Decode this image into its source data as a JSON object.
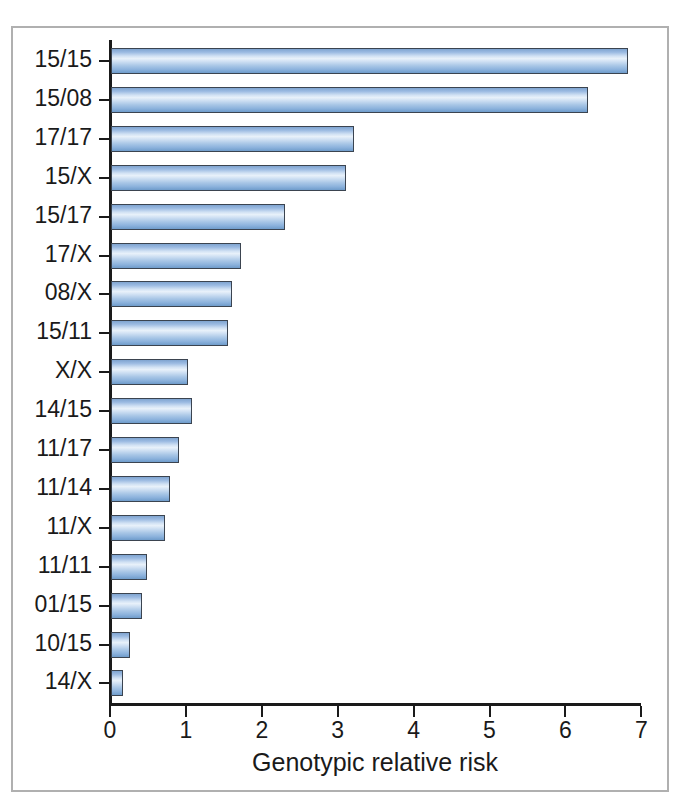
{
  "chart_data": {
    "type": "bar",
    "orientation": "horizontal",
    "title": "",
    "xlabel": "Genotypic relative risk",
    "ylabel": "",
    "xlim": [
      0,
      7
    ],
    "xticks": [
      "0",
      "1",
      "2",
      "3",
      "4",
      "5",
      "6",
      "7"
    ],
    "grid": false,
    "legend": false,
    "bar_color": "#a8c6e6",
    "bar_edge_color": "#3b4450",
    "axis_color": "#1a1a1a",
    "frame_color": "#b0b0b0",
    "categories": [
      "15/15",
      "15/08",
      "17/17",
      "15/X",
      "15/17",
      "17/X",
      "08/X",
      "15/11",
      "X/X",
      "14/15",
      "11/17",
      "11/14",
      "11/X",
      "11/11",
      "01/15",
      "10/15",
      "14/X"
    ],
    "values": [
      6.81,
      6.29,
      3.2,
      3.1,
      2.29,
      1.71,
      1.59,
      1.54,
      1.01,
      1.07,
      0.9,
      0.78,
      0.71,
      0.47,
      0.41,
      0.25,
      0.16
    ]
  }
}
